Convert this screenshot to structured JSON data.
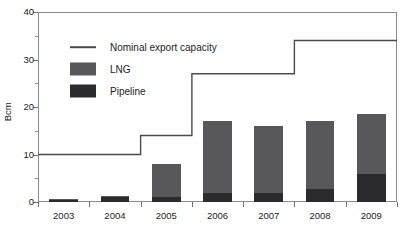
{
  "chart_data": {
    "type": "bar",
    "title": "",
    "subtitle": "",
    "xlabel": "",
    "ylabel": "Bcm",
    "categories": [
      "2003",
      "2004",
      "2005",
      "2006",
      "2007",
      "2008",
      "2009"
    ],
    "series": [
      {
        "name": "Pipeline",
        "type": "bar",
        "stack": "total",
        "color": "#2b2b2d",
        "values": [
          0.5,
          1.2,
          1.0,
          2.0,
          2.0,
          2.8,
          6.0
        ]
      },
      {
        "name": "LNG",
        "type": "bar",
        "stack": "total",
        "color": "#58585a",
        "values": [
          0.1,
          0.1,
          7.0,
          15.0,
          14.0,
          14.2,
          12.5
        ]
      },
      {
        "name": "Nominal export capacity",
        "type": "line",
        "color": "#4a4a4a",
        "values": [
          10,
          10,
          14,
          27,
          27,
          34,
          34
        ]
      }
    ],
    "totals": [
      0.6,
      1.3,
      8.0,
      17.0,
      16.0,
      17.0,
      18.5
    ],
    "ylim": [
      0,
      40
    ],
    "y_ticks_major": [
      0,
      10,
      20,
      30,
      40
    ],
    "y_ticks_minor": [
      5,
      15,
      25,
      35
    ],
    "grid": false,
    "legend_position": "upper-left-inside",
    "legend": [
      {
        "label": "Nominal export capacity",
        "key": "line",
        "color": "#4a4a4a"
      },
      {
        "label": "LNG",
        "key": "swatch",
        "color": "#58585a"
      },
      {
        "label": "Pipeline",
        "key": "swatch",
        "color": "#2b2b2d"
      }
    ]
  },
  "axes": {
    "y_title": "Bcm",
    "y_tick_labels": [
      "0",
      "10",
      "20",
      "30",
      "40"
    ],
    "x_tick_labels": [
      "2003",
      "2004",
      "2005",
      "2006",
      "2007",
      "2008",
      "2009"
    ]
  }
}
